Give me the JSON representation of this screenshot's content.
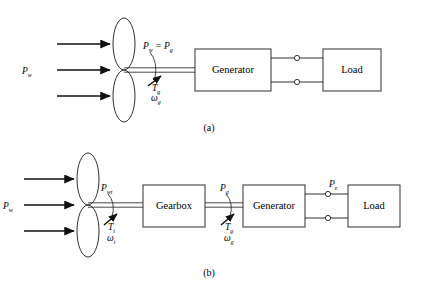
{
  "figure": {
    "type": "block-diagram",
    "panels": [
      {
        "id": "a",
        "caption": "(a)",
        "caption_x": 209,
        "caption_y": 131,
        "rotor": {
          "name": "wind-turbine-rotor",
          "hub_x": 124,
          "hub_y": 70,
          "blade_rx": 11,
          "blade_ry": 26
        },
        "wind_arrows": [
          {
            "x1": 57,
            "x2": 112,
            "y": 44
          },
          {
            "x1": 57,
            "x2": 112,
            "y": 70
          },
          {
            "x1": 57,
            "x2": 112,
            "y": 96
          }
        ],
        "wind_label": {
          "base": "P",
          "sub": "w",
          "x": 22,
          "y": 74
        },
        "shaft": {
          "x1": 124,
          "x2": 195,
          "y": 70,
          "gap": 2.2
        },
        "shaft_power_label": {
          "text_parts": [
            {
              "base": "P",
              "sub": "w"
            },
            {
              "base": " = ",
              "sub": ""
            },
            {
              "base": "P",
              "sub": "g"
            }
          ],
          "plain": "Pw = Pg",
          "x": 143,
          "y": 49
        },
        "torque_label": {
          "base": "T",
          "sub": "g",
          "x": 152,
          "y": 91
        },
        "speed_label": {
          "base": "ω",
          "sub": "g",
          "x": 151,
          "y": 101
        },
        "boxes": [
          {
            "name": "generator-box",
            "label": "Generator",
            "x": 195,
            "y": 49,
            "w": 76,
            "h": 42
          },
          {
            "name": "load-box",
            "label": "Load",
            "x": 323,
            "y": 49,
            "w": 58,
            "h": 42
          }
        ],
        "terminals": [
          {
            "cx": 297,
            "cy": 58,
            "r": 2.6
          },
          {
            "cx": 297,
            "cy": 82,
            "r": 2.6
          }
        ],
        "electric_lines": [
          {
            "x1": 271,
            "x2": 294,
            "y": 58
          },
          {
            "x1": 300,
            "x2": 323,
            "y": 58
          },
          {
            "x1": 271,
            "x2": 294,
            "y": 82
          },
          {
            "x1": 300,
            "x2": 323,
            "y": 82
          }
        ]
      },
      {
        "id": "b",
        "caption": "(b)",
        "caption_x": 209,
        "caption_y": 276,
        "rotor": {
          "name": "wind-turbine-rotor",
          "hub_x": 88,
          "hub_y": 205,
          "blade_rx": 11,
          "blade_ry": 26
        },
        "wind_arrows": [
          {
            "x1": 24,
            "x2": 76,
            "y": 179
          },
          {
            "x1": 24,
            "x2": 76,
            "y": 205
          },
          {
            "x1": 24,
            "x2": 76,
            "y": 231
          }
        ],
        "wind_label": {
          "base": "P",
          "sub": "w",
          "x": 3,
          "y": 209
        },
        "shafts": [
          {
            "x1": 88,
            "x2": 143,
            "y": 205,
            "gap": 2.2
          },
          {
            "x1": 205,
            "x2": 243,
            "y": 205,
            "gap": 2.2
          }
        ],
        "power_labels": [
          {
            "base": "P",
            "sub": "wt",
            "x": 101,
            "y": 191
          },
          {
            "base": "P",
            "sub": "g",
            "x": 220,
            "y": 191
          },
          {
            "base": "P",
            "sub": "e",
            "x": 329,
            "y": 187
          }
        ],
        "torque_labels": [
          {
            "base": "T",
            "sub": "t",
            "x": 108,
            "y": 230
          },
          {
            "base": "T",
            "sub": "g",
            "x": 225,
            "y": 230
          }
        ],
        "speed_labels": [
          {
            "base": "ω",
            "sub": "t",
            "x": 107,
            "y": 241
          },
          {
            "base": "ω",
            "sub": "g",
            "x": 224,
            "y": 241
          }
        ],
        "boxes": [
          {
            "name": "gearbox-box",
            "label": "Gearbox",
            "x": 143,
            "y": 185,
            "w": 62,
            "h": 42
          },
          {
            "name": "generator-box",
            "label": "Generator",
            "x": 243,
            "y": 185,
            "w": 62,
            "h": 42
          },
          {
            "name": "load-box",
            "label": "Load",
            "x": 348,
            "y": 185,
            "w": 52,
            "h": 42
          }
        ],
        "terminals": [
          {
            "cx": 328,
            "cy": 194,
            "r": 2.6
          },
          {
            "cx": 328,
            "cy": 218,
            "r": 2.6
          }
        ],
        "electric_lines": [
          {
            "x1": 305,
            "x2": 325,
            "y": 194
          },
          {
            "x1": 331,
            "x2": 348,
            "y": 194
          },
          {
            "x1": 305,
            "x2": 325,
            "y": 218
          },
          {
            "x1": 331,
            "x2": 348,
            "y": 218
          }
        ]
      }
    ]
  },
  "colors": {
    "line": "#1a1a1a",
    "text": "#000000",
    "background": "#ffffff"
  }
}
